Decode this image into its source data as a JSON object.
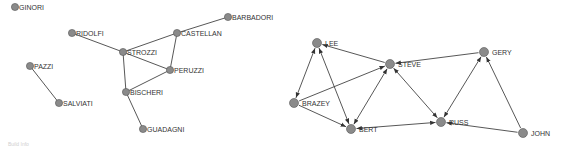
{
  "colors": {
    "node_fill": "#8a8a8a",
    "node_stroke": "#555555",
    "edge": "#444444",
    "label": "#333333"
  },
  "networks": [
    {
      "name": "florentine-families",
      "directed": false,
      "nodes": [
        {
          "id": "GINORI",
          "label": "GINORI",
          "x": 15,
          "y": 7
        },
        {
          "id": "RIDOLFI",
          "label": "RIDOLFI",
          "x": 72,
          "y": 33
        },
        {
          "id": "STROZZI",
          "label": "STROZZI",
          "x": 123,
          "y": 52
        },
        {
          "id": "CASTELLAN",
          "label": "CASTELLAN",
          "x": 177,
          "y": 33
        },
        {
          "id": "BARBADORI",
          "label": "BARBADORI",
          "x": 228,
          "y": 17
        },
        {
          "id": "PERUZZI",
          "label": "PERUZZI",
          "x": 170,
          "y": 70
        },
        {
          "id": "BISCHERI",
          "label": "BISCHERI",
          "x": 126,
          "y": 92
        },
        {
          "id": "GUADAGNI",
          "label": "GUADAGNI",
          "x": 143,
          "y": 129
        },
        {
          "id": "PAZZI",
          "label": "PAZZI",
          "x": 30,
          "y": 66
        },
        {
          "id": "SALVIATI",
          "label": "SALVIATI",
          "x": 59,
          "y": 103
        }
      ],
      "edges": [
        [
          "RIDOLFI",
          "STROZZI"
        ],
        [
          "STROZZI",
          "CASTELLAN"
        ],
        [
          "CASTELLAN",
          "BARBADORI"
        ],
        [
          "CASTELLAN",
          "PERUZZI"
        ],
        [
          "STROZZI",
          "PERUZZI"
        ],
        [
          "STROZZI",
          "BISCHERI"
        ],
        [
          "PERUZZI",
          "BISCHERI"
        ],
        [
          "BISCHERI",
          "GUADAGNI"
        ],
        [
          "PAZZI",
          "SALVIATI"
        ]
      ]
    },
    {
      "name": "directed-network",
      "directed": true,
      "nodes": [
        {
          "id": "LEE",
          "label": "LEE",
          "x": 317,
          "y": 43
        },
        {
          "id": "STEVE",
          "label": "STEVE",
          "x": 390,
          "y": 64
        },
        {
          "id": "GERY",
          "label": "GERY",
          "x": 484,
          "y": 52
        },
        {
          "id": "BRAZEY",
          "label": "BRAZEY",
          "x": 294,
          "y": 103
        },
        {
          "id": "BERT",
          "label": "BERT",
          "x": 351,
          "y": 129
        },
        {
          "id": "RUSS",
          "label": "RUSS",
          "x": 441,
          "y": 122
        },
        {
          "id": "JOHN",
          "label": "JOHN",
          "x": 523,
          "y": 133
        }
      ],
      "edges": [
        {
          "from": "STEVE",
          "to": "LEE",
          "both": false
        },
        {
          "from": "BRAZEY",
          "to": "LEE",
          "both": true
        },
        {
          "from": "BERT",
          "to": "LEE",
          "both": true
        },
        {
          "from": "GERY",
          "to": "STEVE",
          "both": false
        },
        {
          "from": "BRAZEY",
          "to": "STEVE",
          "both": false
        },
        {
          "from": "BERT",
          "to": "STEVE",
          "both": true
        },
        {
          "from": "RUSS",
          "to": "STEVE",
          "both": true
        },
        {
          "from": "BRAZEY",
          "to": "BERT",
          "both": false
        },
        {
          "from": "RUSS",
          "to": "BERT",
          "both": true
        },
        {
          "from": "RUSS",
          "to": "GERY",
          "both": true
        },
        {
          "from": "JOHN",
          "to": "GERY",
          "both": false
        },
        {
          "from": "JOHN",
          "to": "RUSS",
          "both": false
        }
      ]
    }
  ],
  "caption": "Build Info"
}
